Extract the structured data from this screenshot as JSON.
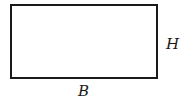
{
  "diagram": {
    "shape": "rectangle",
    "labels": {
      "height": "H",
      "base": "B"
    },
    "colors": {
      "stroke": "#1a1a1a",
      "background": "#ffffff"
    }
  }
}
